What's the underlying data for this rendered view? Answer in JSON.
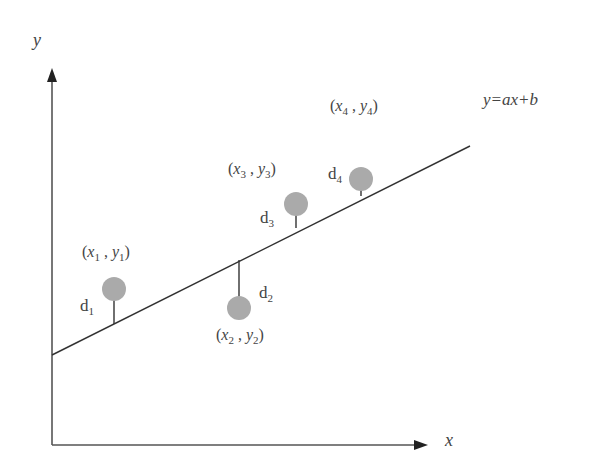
{
  "diagram": {
    "axes": {
      "x_label": "x",
      "y_label": "y"
    },
    "line_equation": "y=ax+b",
    "points": [
      {
        "label_x": "x",
        "label_y": "y",
        "index": "1",
        "distance_label": "d",
        "distance_index": "1"
      },
      {
        "label_x": "x",
        "label_y": "y",
        "index": "2",
        "distance_label": "d",
        "distance_index": "2"
      },
      {
        "label_x": "x",
        "label_y": "y",
        "index": "3",
        "distance_label": "d",
        "distance_index": "3"
      },
      {
        "label_x": "x",
        "label_y": "y",
        "index": "4",
        "distance_label": "d",
        "distance_index": "4"
      }
    ],
    "colors": {
      "axis": "#555555",
      "line": "#333333",
      "point": "#a9a9a9"
    }
  }
}
